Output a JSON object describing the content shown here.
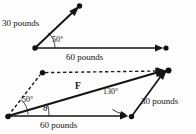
{
  "figure": {
    "title": "",
    "top_diagram": {
      "name": "vector-diagram-two-forces",
      "labels": {
        "force_30": "30 pounds",
        "angle_50": "50°",
        "force_60": "60 pounds"
      },
      "geometry": {
        "origin": [
          35,
          48
        ],
        "arrow_30_tip": [
          76,
          9
        ],
        "arrow_30_dot": [
          78,
          7
        ],
        "arrow_60_tip": [
          158,
          48
        ],
        "arrow_60_dot": [
          163,
          48
        ],
        "arc_radius": 20,
        "angle_between_deg": 50
      }
    },
    "bottom_diagram": {
      "name": "vector-parallelogram-resultant",
      "labels": {
        "angle_50": "50°",
        "resultant": "F",
        "angle_130": "130°",
        "force_30": "30 pounds",
        "theta": "θ",
        "force_60": "60 pounds"
      },
      "geometry": {
        "origin": [
          8,
          116
        ],
        "apex": [
          167,
          71
        ],
        "base_arrow_tip": [
          124,
          116
        ],
        "base_dot": [
          130,
          117
        ],
        "dashed_dot": [
          42,
          73
        ],
        "angle_50_deg": 50,
        "angle_130_deg": 130,
        "theta_deg": 16
      }
    }
  },
  "colors": {
    "ink": "#141414",
    "line": "#1a1a1a",
    "background": "#fdfdfc"
  }
}
